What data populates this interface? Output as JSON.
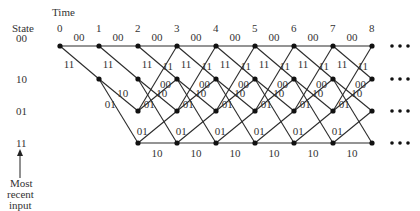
{
  "header": {
    "time_label": "Time",
    "state_label": "State"
  },
  "time_ticks": [
    "0",
    "1",
    "2",
    "3",
    "4",
    "5",
    "6",
    "7",
    "8"
  ],
  "states": [
    "00",
    "10",
    "01",
    "11"
  ],
  "edge_labels": {
    "s00_to_s00": "00",
    "s00_to_s10": "11",
    "s10_to_s01": "10",
    "s10_to_s11": "01",
    "s01_to_s00": "11",
    "s01_to_s10": "00",
    "s11_to_s01": "01",
    "s11_to_s11": "10"
  },
  "continuation": "•••",
  "annotation": {
    "line1": "Most",
    "line2": "recent",
    "line3": "input"
  },
  "geometry": {
    "node_x": [
      60,
      99,
      138,
      177,
      216,
      255,
      294,
      333,
      372
    ],
    "row_y": [
      46,
      79,
      111,
      143
    ]
  }
}
